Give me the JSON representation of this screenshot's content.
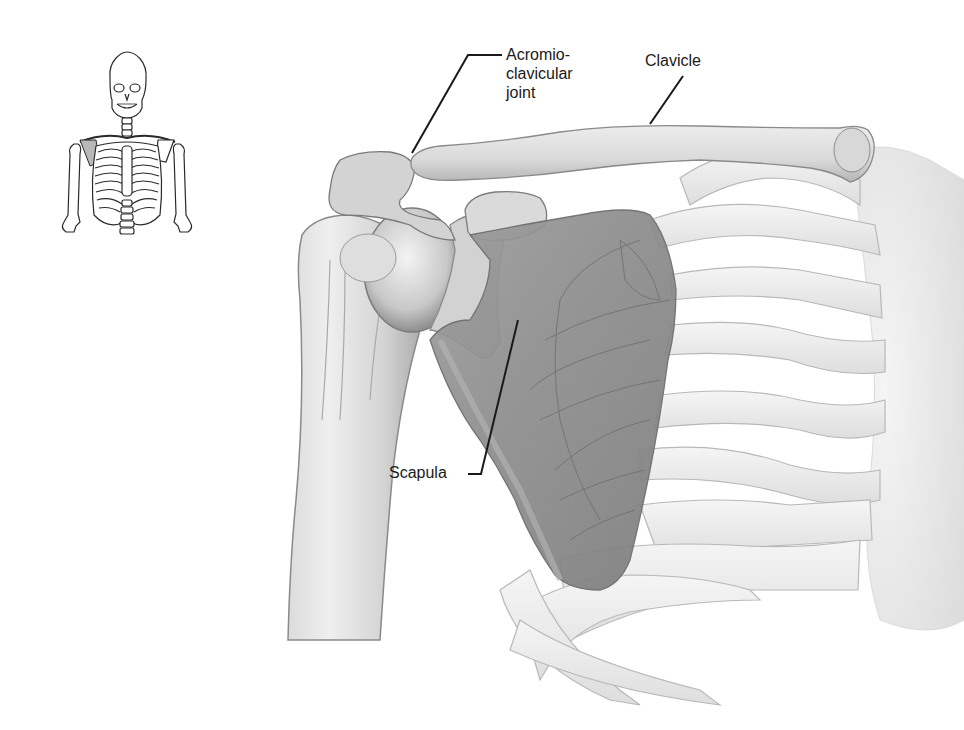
{
  "figure": {
    "labels": {
      "acromioclavicular_joint": "Acromio-\nclavicular\njoint",
      "clavicle": "Clavicle",
      "scapula": "Scapula"
    },
    "inset": {
      "description": "Full skeleton torso thumbnail with right shoulder region highlighted",
      "highlight_color": "#b8b8b8"
    },
    "colors": {
      "bone_fill": "#f1f1f1",
      "bone_shade": "#c9c9c9",
      "bone_outline": "#9a9a9a",
      "scapula_fill": "#8f8f8f",
      "leader_line": "#1a1a1a",
      "label_text": "#1a1a1a",
      "background": "#ffffff"
    }
  }
}
